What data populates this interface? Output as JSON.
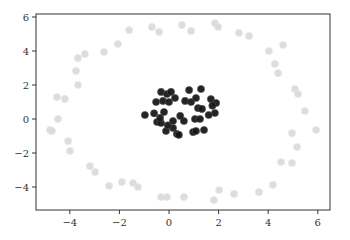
{
  "chart_data": {
    "type": "scatter",
    "title": "",
    "xlabel": "",
    "ylabel": "",
    "xlim": [
      -5.3,
      6.5
    ],
    "ylim": [
      -5.2,
      6.3
    ],
    "grid": false,
    "legend": null,
    "xticks": [
      -4,
      -2,
      0,
      2,
      4,
      6
    ],
    "yticks": [
      -4,
      -2,
      0,
      2,
      4,
      6
    ],
    "xtick_labels": [
      "−4",
      "−2",
      "0",
      "2",
      "4",
      "6"
    ],
    "ytick_labels": [
      "−4",
      "−2",
      "0",
      "2",
      "4",
      "6"
    ],
    "series": [
      {
        "name": "outer ring",
        "color": "#d9d9d9",
        "points": [
          [
            -1.61,
            5.35
          ],
          [
            -2.06,
            4.53
          ],
          [
            -2.62,
            4.06
          ],
          [
            -3.39,
            3.94
          ],
          [
            -3.67,
            3.7
          ],
          [
            -3.75,
            2.94
          ],
          [
            -3.67,
            2.12
          ],
          [
            -4.52,
            1.41
          ],
          [
            -4.2,
            1.3
          ],
          [
            -0.69,
            5.53
          ],
          [
            -0.4,
            5.24
          ],
          [
            0.52,
            5.65
          ],
          [
            0.89,
            5.3
          ],
          [
            1.85,
            5.76
          ],
          [
            1.98,
            5.53
          ],
          [
            2.82,
            5.18
          ],
          [
            3.23,
            5.0
          ],
          [
            4.6,
            4.47
          ],
          [
            4.03,
            4.12
          ],
          [
            4.27,
            3.35
          ],
          [
            4.4,
            2.82
          ],
          [
            5.08,
            1.88
          ],
          [
            5.2,
            1.59
          ],
          [
            5.48,
            0.59
          ],
          [
            -4.48,
            0.12
          ],
          [
            -4.8,
            -0.53
          ],
          [
            -4.72,
            -0.59
          ],
          [
            -4.07,
            -1.18
          ],
          [
            -3.99,
            -1.76
          ],
          [
            -3.19,
            -2.65
          ],
          [
            -2.98,
            -3.0
          ],
          [
            -2.42,
            -3.82
          ],
          [
            -1.9,
            -3.59
          ],
          [
            -1.45,
            -3.65
          ],
          [
            -1.25,
            -3.88
          ],
          [
            -0.32,
            -4.47
          ],
          [
            -0.08,
            -4.47
          ],
          [
            0.6,
            -4.47
          ],
          [
            2.02,
            -4.06
          ],
          [
            1.81,
            -4.65
          ],
          [
            2.62,
            -4.29
          ],
          [
            5.93,
            -0.53
          ],
          [
            4.96,
            -0.71
          ],
          [
            5.16,
            -1.53
          ],
          [
            4.52,
            -2.41
          ],
          [
            4.96,
            -2.47
          ],
          [
            4.19,
            -3.76
          ],
          [
            3.63,
            -4.18
          ]
        ]
      },
      {
        "name": "inner cluster",
        "color": "#111111",
        "points": [
          [
            -0.32,
            1.71
          ],
          [
            -0.08,
            1.59
          ],
          [
            0.08,
            1.71
          ],
          [
            -0.52,
            1.12
          ],
          [
            -0.24,
            1.18
          ],
          [
            0.0,
            1.12
          ],
          [
            0.24,
            1.35
          ],
          [
            -0.97,
            0.35
          ],
          [
            -0.2,
            0.53
          ],
          [
            -0.48,
            -0.06
          ],
          [
            -0.32,
            -0.12
          ],
          [
            0.16,
            0.0
          ],
          [
            -0.12,
            -0.59
          ],
          [
            0.16,
            -0.41
          ],
          [
            0.32,
            -0.76
          ],
          [
            -0.36,
            0.18
          ],
          [
            0.81,
            1.82
          ],
          [
            1.29,
            1.88
          ],
          [
            0.65,
            1.18
          ],
          [
            0.89,
            1.12
          ],
          [
            1.09,
            1.35
          ],
          [
            1.69,
            1.29
          ],
          [
            1.9,
            1.06
          ],
          [
            1.17,
            0.76
          ],
          [
            1.33,
            0.71
          ],
          [
            1.85,
            0.47
          ],
          [
            0.6,
            0.0
          ],
          [
            1.05,
            0.12
          ],
          [
            1.25,
            0.12
          ],
          [
            0.97,
            -0.65
          ],
          [
            1.09,
            -0.59
          ],
          [
            1.41,
            -0.53
          ],
          [
            0.4,
            -0.82
          ],
          [
            -0.6,
            0.45
          ],
          [
            0.45,
            0.3
          ],
          [
            1.6,
            0.35
          ],
          [
            -0.05,
            -0.25
          ],
          [
            1.75,
            0.9
          ]
        ]
      }
    ]
  }
}
